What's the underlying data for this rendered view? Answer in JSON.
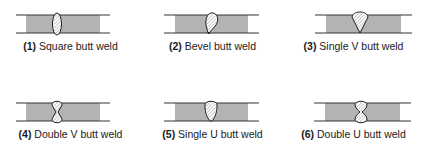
{
  "colors": {
    "plate_fill": "#b3b3b3",
    "line": "#333333",
    "weld_outline": "#1a1a1a",
    "weld_fill": "#ffffff",
    "hatch": "#888888"
  },
  "welds": [
    {
      "number": "(1)",
      "name": "Square butt weld",
      "type": "square"
    },
    {
      "number": "(2)",
      "name": "Bevel butt weld",
      "type": "bevel"
    },
    {
      "number": "(3)",
      "name": "Single V butt weld",
      "type": "single-v"
    },
    {
      "number": "(4)",
      "name": "Double V butt weld",
      "type": "double-v"
    },
    {
      "number": "(5)",
      "name": "Single U butt weld",
      "type": "single-u"
    },
    {
      "number": "(6)",
      "name": "Double U butt weld",
      "type": "double-u"
    }
  ]
}
